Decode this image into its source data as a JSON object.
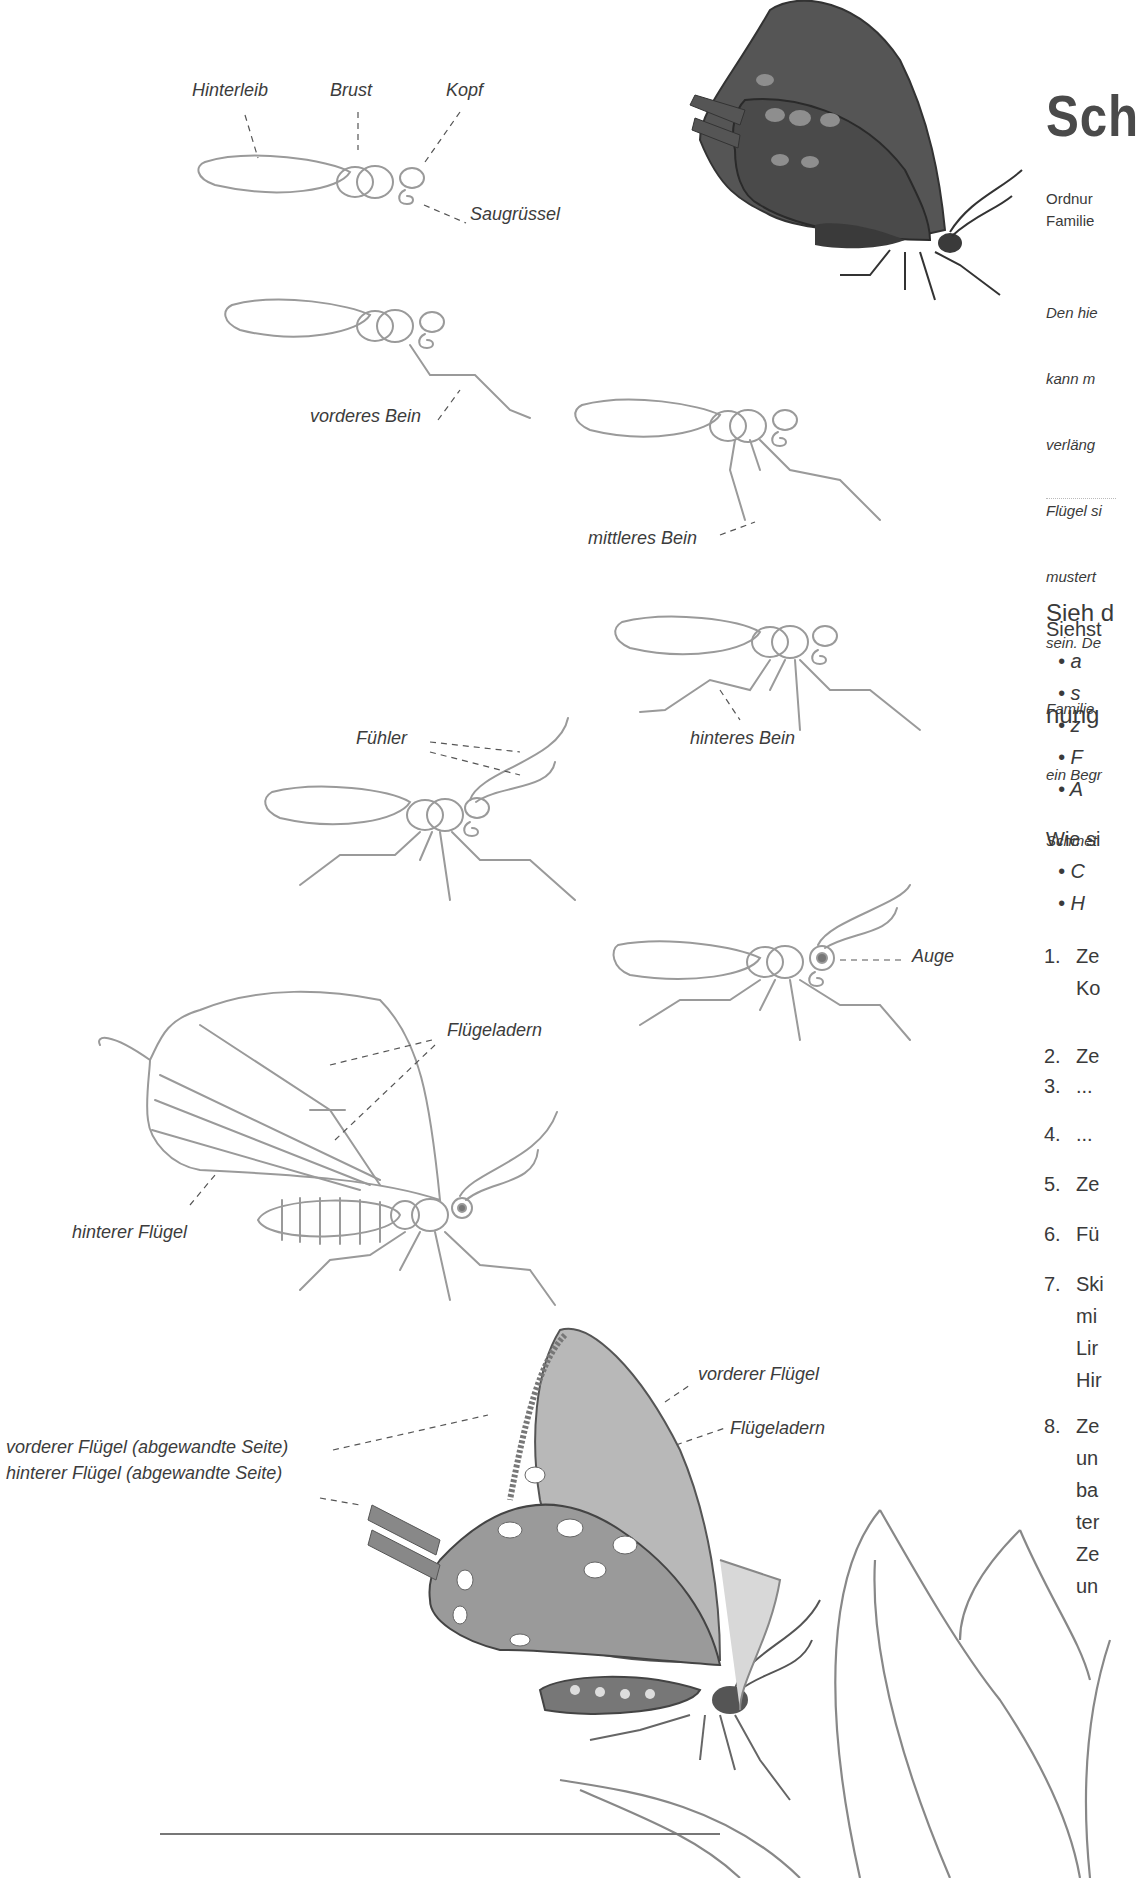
{
  "page": {
    "title": "Sch",
    "meta": {
      "order": "Ordnur",
      "family": "Familie"
    },
    "intro_lines": [
      "Den hie",
      "kann m",
      "verläng",
      "Flügel si",
      "mustert",
      "sein. De",
      "Familie",
      "ein Begr",
      "Schmet"
    ],
    "heading_lines": [
      "Sieh d",
      "nung"
    ],
    "question1": "Siehst",
    "bullets1": [
      "a",
      "s",
      "z",
      "F",
      "A"
    ],
    "question2": "Wie si",
    "bullets2": [
      "C",
      "H"
    ],
    "steps": [
      {
        "num": "1.",
        "text": "Ze\nKo"
      },
      {
        "num": "2.",
        "text": "Ze"
      },
      {
        "num": "3.",
        "text": "..."
      },
      {
        "num": "4.",
        "text": "..."
      },
      {
        "num": "5.",
        "text": "Ze"
      },
      {
        "num": "6.",
        "text": "Fü"
      },
      {
        "num": "7.",
        "text": "Ski\nmi\nLir\nHir"
      },
      {
        "num": "8.",
        "text": "Ze\nun\nba\nter\nZe\nun"
      }
    ]
  },
  "figures": {
    "step1": {
      "abdomen": "Hinterleib",
      "thorax": "Brust",
      "head": "Kopf",
      "proboscis": "Saugrüssel"
    },
    "step2": {
      "front_leg": "vorderes Bein"
    },
    "step3": {
      "middle_leg": "mittleres Bein"
    },
    "step4": {
      "hind_leg": "hinteres Bein"
    },
    "step5": {
      "antennae": "Fühler"
    },
    "step6": {
      "eye": "Auge"
    },
    "step7": {
      "wing_veins": "Flügeladern",
      "hind_wing": "hinterer Flügel"
    },
    "step8": {
      "front_wing": "vorderer Flügel",
      "wing_veins": "Flügeladern",
      "front_wing_far": "vorderer Flügel (abgewandte Seite)",
      "hind_wing_far": "hinterer Flügel (abgewandte Seite)"
    }
  },
  "colors": {
    "text": "#3a3a3a",
    "sketch": "#9a9a9a",
    "dark_wing": "#4e4e4e",
    "spots": "#8c8c8c"
  }
}
